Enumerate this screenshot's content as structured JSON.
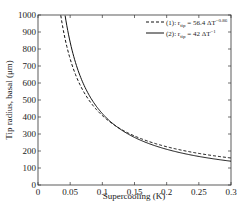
{
  "chart_data": {
    "type": "line",
    "title": "",
    "xlabel": "Supercooling (K)",
    "ylabel": "Tip radius, basal (μm)",
    "xlim": [
      0,
      0.3
    ],
    "ylim": [
      0,
      1000
    ],
    "xticks": [
      "0",
      "0.05",
      "0.1",
      "0.15",
      "0.2",
      "0.25",
      "0.3"
    ],
    "yticks": [
      "0",
      "100",
      "200",
      "300",
      "400",
      "500",
      "600",
      "700",
      "800",
      "900",
      "1000"
    ],
    "grid": false,
    "legend_position": "upper right",
    "series": [
      {
        "name": "(1): r_tip = 56.4 ΔT^-0.86",
        "formula": "56.4*x^-0.86",
        "style": "dashed",
        "x": [
          0.04,
          0.05,
          0.075,
          0.1,
          0.15,
          0.2,
          0.25,
          0.3
        ],
        "values": [
          1000,
          736,
          517,
          407,
          287,
          225,
          185,
          159
        ]
      },
      {
        "name": "(2): r_tip = 42 ΔT^-1",
        "formula": "42*x^-1",
        "style": "solid",
        "x": [
          0.042,
          0.05,
          0.075,
          0.1,
          0.15,
          0.2,
          0.25,
          0.3
        ],
        "values": [
          1000,
          840,
          560,
          420,
          280,
          210,
          168,
          140
        ]
      }
    ]
  },
  "legend": {
    "item1_prefix": "(1): r",
    "item1_sub": "tip",
    "item1_eq": " = 56.4 ΔT",
    "item1_exp": "−0.86",
    "item2_prefix": "(2): r",
    "item2_sub": "tip",
    "item2_eq": " = 42 ΔT",
    "item2_exp": "−1"
  }
}
